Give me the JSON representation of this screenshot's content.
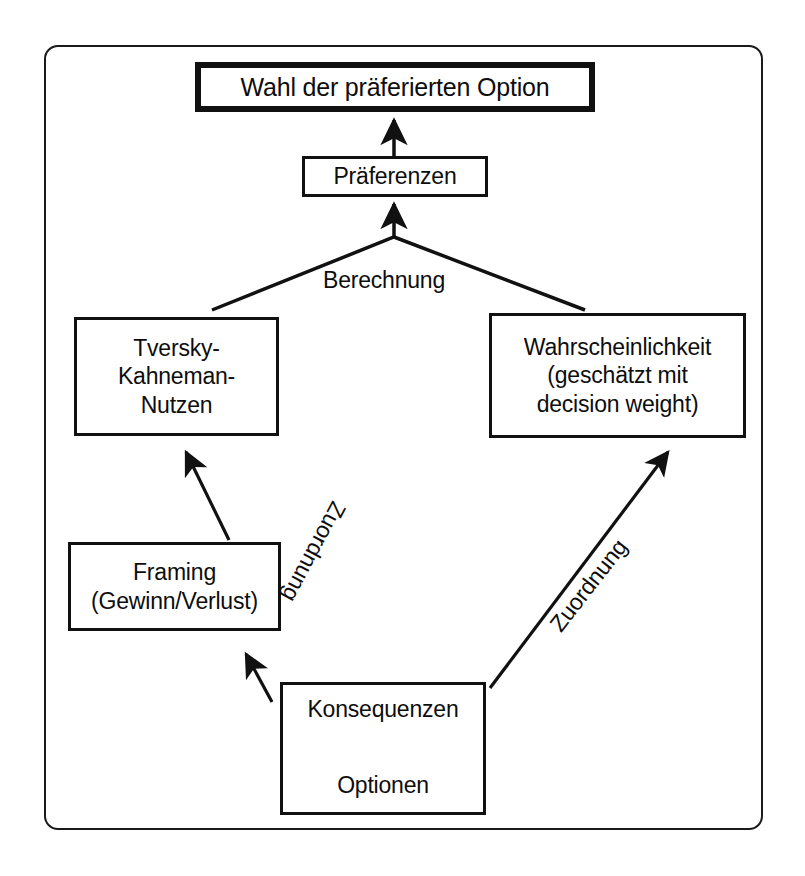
{
  "diagram": {
    "frame_color": "#1a1a1a",
    "box_color": "#111111",
    "background": "#ffffff",
    "nodes": {
      "choice": {
        "line1": "Wahl der präferierten Option"
      },
      "preferences": {
        "line1": "Präferenzen"
      },
      "utility": {
        "line1": "Tversky-",
        "line2": "Kahneman-",
        "line3": "Nutzen"
      },
      "probability": {
        "line1": "Wahrscheinlichkeit",
        "line2": "(geschätzt mit",
        "line3": "decision weight)"
      },
      "framing": {
        "line1": "Framing",
        "line2": "(Gewinn/Verlust)"
      },
      "consequences": {
        "line1": "Konsequenzen",
        "line2": "Optionen"
      }
    },
    "edge_labels": {
      "berechnung": "Berechnung",
      "zuordnung_left": "Zuordnung",
      "zuordnung_right": "Zuordnung"
    }
  }
}
